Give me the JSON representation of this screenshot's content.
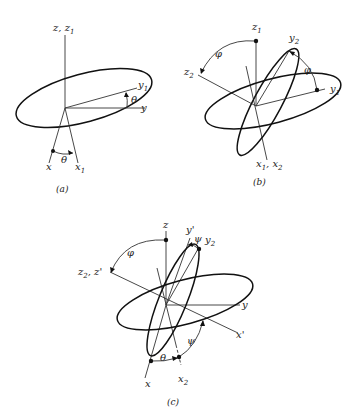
{
  "figure": {
    "panels": [
      {
        "id": "a",
        "caption": "(a)",
        "description": "Rotation by angle theta about z axis",
        "labels": {
          "z_axis": "z, z",
          "z_sub": "1",
          "y1": "y",
          "y1_sub": "1",
          "y": "y",
          "x": "x",
          "x1": "x",
          "x1_sub": "1",
          "theta_top": "θ",
          "theta_bottom": "θ"
        }
      },
      {
        "id": "b",
        "caption": "(b)",
        "description": "Rotation by angle phi about x1 axis",
        "labels": {
          "z1": "z",
          "z1_sub": "1",
          "z2": "z",
          "z2_sub": "2",
          "y2": "y",
          "y2_sub": "2",
          "y1": "y",
          "y1_sub": "1",
          "x1x2": "x",
          "x1x2_sub1": "1",
          "x1x2_mid": ", x",
          "x1x2_sub2": "2",
          "phi_left": "φ",
          "phi_right": "φ"
        }
      },
      {
        "id": "c",
        "caption": "(c)",
        "description": "Rotation by angle psi about z2 axis — combined Euler angles",
        "labels": {
          "z": "z",
          "yprime": "y'",
          "psi_top": "ψ",
          "y2": "y",
          "y2_sub": "2",
          "z2zprime": "z",
          "z2zprime_sub": "2",
          "z2zprime_rest": ", z'",
          "y": "y",
          "xprime": "x'",
          "phi": "φ",
          "psi_bottom": "ψ",
          "theta": "θ",
          "x": "x",
          "x2": "x",
          "x2_sub": "2"
        }
      }
    ]
  }
}
